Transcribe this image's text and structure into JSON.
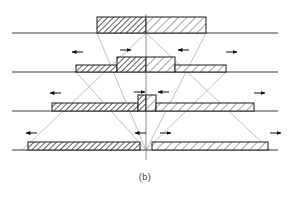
{
  "figure": {
    "caption": "(b)",
    "canvas": {
      "width": 290,
      "height": 198
    },
    "colors": {
      "baseline": "#3c3c3c",
      "outline": "#1c1c1c",
      "hatch_dense": "#2b2b2b",
      "hatch_sparse": "#4a4a4a",
      "guide": "#b8b8b8",
      "centerline": "#6e6e6e",
      "arrow": "#111111",
      "caption": "#3a3a3a",
      "background": "#ffffff"
    },
    "centerline": {
      "x": 146,
      "y_top": 14,
      "y_bottom": 160
    },
    "baselines": [
      {
        "name": "stage-1-baseline",
        "y": 33,
        "x1": 12,
        "x2": 278
      },
      {
        "name": "stage-2-baseline",
        "y": 72,
        "x1": 12,
        "x2": 278
      },
      {
        "name": "stage-3-baseline",
        "y": 111,
        "x1": 12,
        "x2": 278
      },
      {
        "name": "stage-4-baseline",
        "y": 150,
        "x1": 12,
        "x2": 278
      }
    ],
    "guides": [
      {
        "name": "guide-outer-left",
        "x1": 146,
        "y1": 33,
        "x2": 22,
        "y2": 150
      },
      {
        "name": "guide-outer-right",
        "x1": 146,
        "y1": 33,
        "x2": 270,
        "y2": 150
      },
      {
        "name": "guide-inner-left",
        "x1": 97,
        "y1": 33,
        "x2": 146,
        "y2": 150
      },
      {
        "name": "guide-inner-right",
        "x1": 206,
        "y1": 33,
        "x2": 146,
        "y2": 150
      },
      {
        "name": "guide-mid-left",
        "x1": 76,
        "y1": 72,
        "x2": 146,
        "y2": 150
      },
      {
        "name": "guide-mid-right",
        "x1": 226,
        "y1": 72,
        "x2": 146,
        "y2": 150
      }
    ],
    "stages": [
      {
        "name": "stage-1",
        "label": "top workpiece pass",
        "blocks": [
          {
            "name": "block-dense",
            "x": 97,
            "y": 17,
            "w": 49,
            "h": 16,
            "hatch": "dense"
          },
          {
            "name": "block-sparse",
            "x": 146,
            "y": 17,
            "w": 60,
            "h": 16,
            "hatch": "sparse"
          }
        ],
        "arrows": []
      },
      {
        "name": "stage-2",
        "label": "second pass stepped profile",
        "blocks": [
          {
            "name": "flank-left",
            "x": 76,
            "y": 65,
            "w": 41,
            "h": 7,
            "hatch": "dense"
          },
          {
            "name": "crown-left",
            "x": 117,
            "y": 57,
            "w": 29,
            "h": 15,
            "hatch": "dense"
          },
          {
            "name": "crown-right",
            "x": 146,
            "y": 57,
            "w": 29,
            "h": 15,
            "hatch": "sparse"
          },
          {
            "name": "flank-right",
            "x": 175,
            "y": 65,
            "w": 51,
            "h": 7,
            "hatch": "sparse"
          }
        ],
        "arrows": [
          {
            "name": "arrow-outer-left",
            "x": 72,
            "y": 52,
            "dir": "left"
          },
          {
            "name": "arrow-inner-left",
            "x": 120,
            "y": 50,
            "dir": "right"
          },
          {
            "name": "arrow-inner-right",
            "x": 178,
            "y": 50,
            "dir": "left"
          },
          {
            "name": "arrow-outer-right",
            "x": 226,
            "y": 52,
            "dir": "right"
          }
        ]
      },
      {
        "name": "stage-3",
        "label": "third pass with central boss",
        "blocks": [
          {
            "name": "plate-left",
            "x": 52,
            "y": 103,
            "w": 86,
            "h": 8,
            "hatch": "dense"
          },
          {
            "name": "boss-left",
            "x": 138,
            "y": 95,
            "w": 8,
            "h": 16,
            "hatch": "dense"
          },
          {
            "name": "boss-right",
            "x": 146,
            "y": 95,
            "w": 10,
            "h": 16,
            "hatch": "sparse"
          },
          {
            "name": "plate-right",
            "x": 156,
            "y": 103,
            "w": 98,
            "h": 8,
            "hatch": "sparse"
          }
        ],
        "arrows": [
          {
            "name": "arrow-outer-left",
            "x": 50,
            "y": 93,
            "dir": "left"
          },
          {
            "name": "arrow-boss-left",
            "x": 134,
            "y": 92,
            "dir": "right"
          },
          {
            "name": "arrow-boss-right",
            "x": 158,
            "y": 92,
            "dir": "left"
          },
          {
            "name": "arrow-outer-right",
            "x": 254,
            "y": 93,
            "dir": "right"
          }
        ]
      },
      {
        "name": "stage-4",
        "label": "final pass split halves",
        "blocks": [
          {
            "name": "half-left",
            "x": 28,
            "y": 142,
            "w": 112,
            "h": 8,
            "hatch": "dense"
          },
          {
            "name": "half-right",
            "x": 152,
            "y": 142,
            "w": 116,
            "h": 8,
            "hatch": "sparse"
          }
        ],
        "arrows": [
          {
            "name": "arrow-outer-left",
            "x": 26,
            "y": 133,
            "dir": "left"
          },
          {
            "name": "arrow-inner-left",
            "x": 135,
            "y": 133,
            "dir": "left"
          },
          {
            "name": "arrow-inner-right",
            "x": 160,
            "y": 133,
            "dir": "right"
          },
          {
            "name": "arrow-outer-right",
            "x": 270,
            "y": 133,
            "dir": "right"
          }
        ]
      }
    ]
  }
}
